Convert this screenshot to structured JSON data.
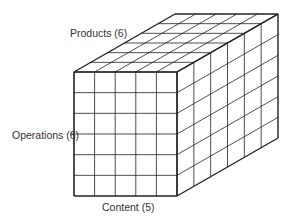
{
  "diagram": {
    "type": "3d-cube-grid",
    "labels": {
      "products": "Products (6)",
      "operations": "Operations (6)",
      "content": "Content (5)"
    },
    "dimensions": {
      "content": 5,
      "operations": 6,
      "products": 6
    },
    "line_color": "#222222"
  }
}
